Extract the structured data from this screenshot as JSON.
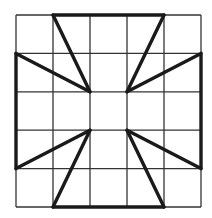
{
  "diagram": {
    "type": "grid-figure",
    "grid": {
      "rows": 5,
      "cols": 5,
      "origin": [
        16,
        15
      ],
      "cell_width": 37,
      "cell_height": 38.4,
      "line_color": "#333333"
    },
    "bold_color": "#1a1a1a",
    "bold_segments_grid": [
      [
        [
          1,
          0
        ],
        [
          4,
          0
        ]
      ],
      [
        [
          1,
          5
        ],
        [
          4,
          5
        ]
      ],
      [
        [
          0,
          1
        ],
        [
          0,
          4
        ]
      ],
      [
        [
          5,
          1
        ],
        [
          5,
          4
        ]
      ],
      [
        [
          1,
          0
        ],
        [
          2,
          2
        ]
      ],
      [
        [
          0,
          1
        ],
        [
          2,
          2
        ]
      ],
      [
        [
          4,
          0
        ],
        [
          3,
          2
        ]
      ],
      [
        [
          5,
          1
        ],
        [
          3,
          2
        ]
      ],
      [
        [
          0,
          4
        ],
        [
          2,
          3
        ]
      ],
      [
        [
          1,
          5
        ],
        [
          2,
          3
        ]
      ],
      [
        [
          5,
          4
        ],
        [
          3,
          3
        ]
      ],
      [
        [
          4,
          5
        ],
        [
          3,
          3
        ]
      ]
    ]
  }
}
